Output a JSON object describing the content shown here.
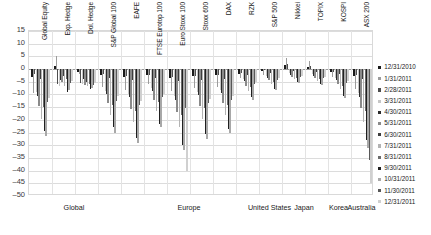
{
  "chart_data": {
    "type": "bar",
    "title": "",
    "xlabel": "",
    "ylabel": "",
    "ylim": [
      -50,
      15
    ],
    "ytick_step": 5,
    "grid": true,
    "legend_position": "right",
    "yticks": [
      "15",
      "10",
      "5",
      "0",
      "-5",
      "-10",
      "-15",
      "-20",
      "-25",
      "-30",
      "-35",
      "-40",
      "-45",
      "-50"
    ],
    "groups": [
      {
        "label": "Global",
        "categories": [
          "Global Equity",
          "Exp. Hedge",
          "Dol. Hedge",
          "S&P Global 100"
        ]
      },
      {
        "label": "Europe",
        "categories": [
          "EAFE",
          "FTSE Eurotop 100",
          "Euro Stoxx 100",
          "Stoxx 600",
          "DAX",
          "RZK"
        ]
      },
      {
        "label": "United States",
        "categories": [
          "S&P 500"
        ]
      },
      {
        "label": "Japan",
        "categories": [
          "Nikkei",
          "TOPIX"
        ]
      },
      {
        "label": "Korea",
        "categories": [
          "KOSPI"
        ]
      },
      {
        "label": "Australia",
        "categories": [
          "ASX 200"
        ]
      }
    ],
    "categories": [
      "Global Equity",
      "Exp. Hedge",
      "Dol. Hedge",
      "S&P Global 100",
      "EAFE",
      "FTSE Eurotop 100",
      "Euro Stoxx 100",
      "Stoxx 600",
      "DAX",
      "RZK",
      "S&P 500",
      "Nikkei",
      "TOPIX",
      "KOSPI",
      "ASX 200"
    ],
    "series": [
      {
        "name": "12/31/2010",
        "color": "#1a1a1a",
        "values": [
          -3.0,
          1.2,
          -1.0,
          -2.4,
          -3.1,
          -2.2,
          -3.4,
          -2.8,
          -2.5,
          -2.0,
          -0.8,
          1.5,
          1.0,
          -1.2,
          -2.6
        ]
      },
      {
        "name": "1/31/2011",
        "color": "#9c9c9c",
        "values": [
          -9.5,
          5.0,
          -1.8,
          -7.2,
          -8.4,
          -6.0,
          -8.8,
          -7.6,
          -7.0,
          -3.5,
          -2.2,
          4.5,
          3.0,
          -3.0,
          -8.0
        ]
      },
      {
        "name": "2/28/2011",
        "color": "#4d4d4d",
        "values": [
          -2.1,
          -6.0,
          -5.5,
          -2.0,
          -2.6,
          -2.4,
          -3.0,
          -2.6,
          -2.2,
          -1.5,
          -0.5,
          2.0,
          1.4,
          -1.0,
          -2.2
        ]
      },
      {
        "name": "3/31/2011",
        "color": "#c6c6c6",
        "values": [
          -9.0,
          -6.6,
          -6.0,
          -8.5,
          -9.8,
          -7.5,
          -10.5,
          -9.0,
          -8.4,
          -4.0,
          -2.8,
          -1.5,
          -2.0,
          -3.6,
          -9.5
        ]
      },
      {
        "name": "4/30/2011",
        "color": "#2b2b2b",
        "values": [
          -10.5,
          -4.2,
          -4.0,
          -9.8,
          -11.2,
          -8.6,
          -12.0,
          -10.4,
          -9.6,
          -4.8,
          -3.4,
          -2.4,
          -2.8,
          -4.2,
          -11.0
        ]
      },
      {
        "name": "5/31/2011",
        "color": "#8a8a8a",
        "values": [
          -14.5,
          -5.2,
          -6.4,
          -13.5,
          -15.6,
          -12.0,
          -17.0,
          -14.5,
          -13.2,
          -6.5,
          -4.5,
          -3.2,
          -3.6,
          -6.0,
          -15.5
        ]
      },
      {
        "name": "6/30/2011",
        "color": "#3d3d3d",
        "values": [
          -4.0,
          -2.6,
          -5.0,
          -3.6,
          -4.4,
          -3.4,
          -4.8,
          -4.2,
          -3.8,
          -2.2,
          -1.4,
          -0.8,
          -1.2,
          -2.0,
          -4.0
        ]
      },
      {
        "name": "7/31/2011",
        "color": "#b3b3b3",
        "values": [
          -19.5,
          -6.8,
          -6.6,
          -18.0,
          -21.0,
          -16.5,
          -23.0,
          -19.5,
          -18.0,
          -8.5,
          -6.0,
          -4.0,
          -4.6,
          -8.0,
          -21.0
        ]
      },
      {
        "name": "8/31/2011",
        "color": "#6b6b6b",
        "values": [
          -15.0,
          -3.8,
          -5.8,
          -14.0,
          -16.5,
          -13.0,
          -18.0,
          -15.5,
          -14.0,
          -7.0,
          -5.0,
          -3.4,
          -3.8,
          -6.6,
          -16.5
        ]
      },
      {
        "name": "9/30/2011",
        "color": "#1f1f1f",
        "values": [
          -24.5,
          -9.0,
          -8.0,
          -23.0,
          -27.0,
          -21.5,
          -30.0,
          -25.5,
          -23.5,
          -11.0,
          -7.8,
          -5.2,
          -5.8,
          -10.5,
          -28.0
        ]
      },
      {
        "name": "10/31/2011",
        "color": "#a8a8a8",
        "values": [
          -26.5,
          -8.2,
          -7.4,
          -25.0,
          -29.0,
          -23.0,
          -32.0,
          -27.5,
          -25.0,
          -12.0,
          -8.4,
          -5.6,
          -6.2,
          -11.5,
          -31.0
        ]
      },
      {
        "name": "11/30/2011",
        "color": "#585858",
        "values": [
          -13.0,
          -5.6,
          -6.2,
          -12.5,
          -14.0,
          -11.0,
          -15.5,
          -13.5,
          -12.2,
          -6.0,
          -4.2,
          -3.0,
          -3.4,
          -5.6,
          -36.0
        ]
      },
      {
        "name": "12/31/2011",
        "color": "#d0d0d0",
        "values": [
          -11.5,
          -4.6,
          -5.4,
          -10.8,
          -12.6,
          -9.8,
          -40.0,
          -11.8,
          -10.8,
          -5.2,
          -3.6,
          -2.6,
          -3.0,
          -4.8,
          -45.0
        ]
      }
    ]
  }
}
